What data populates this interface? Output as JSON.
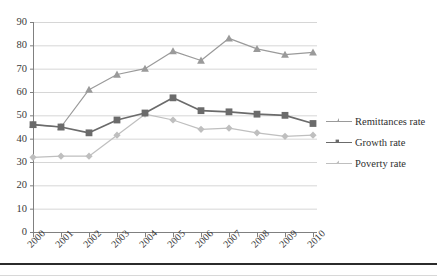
{
  "chart_data": {
    "type": "line",
    "title": "",
    "xlabel": "",
    "ylabel": "",
    "categories": [
      "2000",
      "2001",
      "2002",
      "2003",
      "2004",
      "2005",
      "2006",
      "2007",
      "2008",
      "2009",
      "2010"
    ],
    "ylim": [
      0,
      90
    ],
    "ytick_step": 10,
    "yticks": [
      "0",
      "10",
      "20",
      "30",
      "40",
      "50",
      "60",
      "70",
      "80",
      "90"
    ],
    "grid": "horizontal",
    "legend_position": "right",
    "series": [
      {
        "name": "Remittances rate",
        "marker": "triangle",
        "color": "#9a9a9a",
        "values": [
          46,
          45,
          61,
          67.5,
          70,
          77.5,
          73.5,
          83,
          78.5,
          76,
          77
        ]
      },
      {
        "name": "Growth rate",
        "marker": "square",
        "color": "#6b6b6b",
        "values": [
          46,
          45,
          42.5,
          48,
          51,
          57.5,
          52,
          51.5,
          50.5,
          50,
          46.5
        ]
      },
      {
        "name": "Poverty rate",
        "marker": "diamond",
        "color": "#bfbfbf",
        "values": [
          32,
          32.5,
          32.5,
          41.5,
          50.5,
          48,
          44,
          44.5,
          42.5,
          41,
          41.5
        ]
      }
    ]
  },
  "axis": {
    "line_color": "#808080",
    "grid_color": "#d6d6d6"
  },
  "legend": {
    "items": [
      {
        "label": "Remittances rate"
      },
      {
        "label": "Growth rate"
      },
      {
        "label": "Poverty rate"
      }
    ]
  }
}
